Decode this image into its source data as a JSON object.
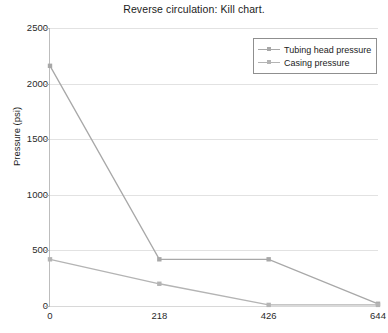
{
  "chart_data": {
    "type": "line",
    "title": "Reverse circulation: Kill chart.",
    "xlabel": "",
    "ylabel": "Pressure (psi)",
    "categories": [
      "0",
      "218",
      "426",
      "644"
    ],
    "x": [
      0,
      218,
      426,
      644
    ],
    "ylim": [
      0,
      2500
    ],
    "yticks": [
      "0",
      "500",
      "1000",
      "1500",
      "2000",
      "2500"
    ],
    "ytick_values": [
      0,
      500,
      1000,
      1500,
      2000,
      2500
    ],
    "grid": true,
    "legend_position": "top-right",
    "series": [
      {
        "name": "Tubing head pressure",
        "values": [
          2160,
          420,
          420,
          20
        ],
        "color": "#a8a8a8",
        "marker": "square"
      },
      {
        "name": "Casing pressure",
        "values": [
          420,
          200,
          10,
          10
        ],
        "color": "#b4b4b4",
        "marker": "square"
      }
    ]
  },
  "axis": {
    "y_title": "Pressure (psi)"
  },
  "colors": {
    "grid": "#e2e2e2",
    "axis": "#bdbdbd",
    "text": "#1b1b1b",
    "legend_border": "#8f8f8f"
  }
}
